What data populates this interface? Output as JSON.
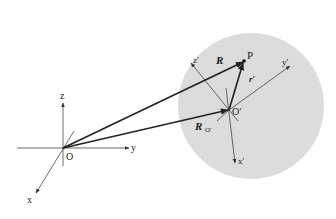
{
  "diagram": {
    "type": "coordinate-frames",
    "colors": {
      "sphere_fill": "#dcdcdc",
      "line": "#333333",
      "vector": "#222222",
      "background": "#ffffff"
    },
    "fixed_frame": {
      "origin_label": "O",
      "axes": {
        "x": "x",
        "y": "y",
        "z": "z"
      }
    },
    "moving_frame": {
      "origin_label": "O′",
      "axes": {
        "x": "x′",
        "y": "y′",
        "z": "z′"
      }
    },
    "point_label": "P",
    "vectors": {
      "R": "R",
      "R_O_main": "R",
      "R_O_sub": "O′",
      "r_prime": "r′"
    }
  }
}
